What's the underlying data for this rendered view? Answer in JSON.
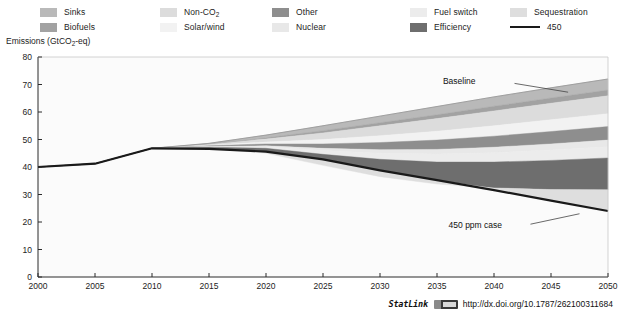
{
  "legend": {
    "items": [
      {
        "label": "Sinks",
        "color": "#b9b9b9",
        "type": "swatch",
        "col": 0,
        "row": 0
      },
      {
        "label": "Biofuels",
        "color": "#a2a2a2",
        "type": "swatch",
        "col": 0,
        "row": 1
      },
      {
        "label": "Non-CO2",
        "color": "#dcdcdc",
        "type": "swatch",
        "col": 1,
        "row": 0,
        "sub": "2",
        "base": "Non-CO"
      },
      {
        "label": "Solar/wind",
        "color": "#f2f2f2",
        "type": "swatch",
        "col": 1,
        "row": 1
      },
      {
        "label": "Other",
        "color": "#8e8e8e",
        "type": "swatch",
        "col": 2,
        "row": 0
      },
      {
        "label": "Nuclear",
        "color": "#e8e8e8",
        "type": "swatch",
        "col": 2,
        "row": 1
      },
      {
        "label": "Fuel switch",
        "color": "#ececec",
        "type": "swatch",
        "col": 3,
        "row": 0
      },
      {
        "label": "Efficiency",
        "color": "#6e6e6e",
        "type": "swatch",
        "col": 3,
        "row": 1
      },
      {
        "label": "Sequestration",
        "color": "#dedede",
        "type": "swatch",
        "col": 4,
        "row": 0
      },
      {
        "label": "450",
        "color": "#1a1a1a",
        "type": "line",
        "col": 4,
        "row": 1
      }
    ]
  },
  "chart_data": {
    "type": "area",
    "title": "",
    "xlabel": "",
    "ylabel": "Emissions (GtCO2-eq)",
    "ylabel_base": "Emissions (GtCO",
    "ylabel_sub": "2",
    "ylabel_tail": "-eq)",
    "xlim": [
      2000,
      2050
    ],
    "ylim": [
      0,
      80
    ],
    "ytick_values": [
      0,
      10,
      20,
      30,
      40,
      50,
      60,
      70,
      80
    ],
    "xtick_values": [
      2000,
      2005,
      2010,
      2015,
      2020,
      2025,
      2030,
      2035,
      2040,
      2045,
      2050
    ],
    "grid": false,
    "legend_position": "top",
    "x": [
      2000,
      2005,
      2010,
      2015,
      2020,
      2025,
      2030,
      2035,
      2040,
      2045,
      2050
    ],
    "series": [
      {
        "name": "Baseline",
        "values": [
          40.0,
          41.2,
          46.8,
          48.6,
          51.6,
          55.0,
          58.5,
          62.0,
          65.5,
          68.8,
          72.0
        ]
      },
      {
        "name": "450 ppm case",
        "values": [
          40.0,
          41.2,
          46.8,
          46.6,
          45.6,
          42.8,
          38.8,
          35.2,
          31.6,
          27.8,
          24.0
        ]
      }
    ],
    "wedges": [
      {
        "name": "Sinks",
        "color": "#b9b9b9",
        "values": [
          0,
          0,
          0,
          0.3,
          1.0,
          1.8,
          2.4,
          3.0,
          3.4,
          3.7,
          4.0
        ]
      },
      {
        "name": "Biofuels",
        "color": "#a2a2a2",
        "values": [
          0,
          0,
          0,
          0.1,
          0.4,
          0.8,
          1.1,
          1.4,
          1.7,
          1.9,
          2.1
        ]
      },
      {
        "name": "Non-CO2",
        "color": "#dcdcdc",
        "values": [
          0,
          0,
          0,
          0.3,
          1.1,
          2.4,
          3.6,
          4.6,
          5.4,
          6.0,
          6.5
        ]
      },
      {
        "name": "Solar/wind",
        "color": "#f2f2f2",
        "values": [
          0,
          0,
          0,
          0.2,
          0.7,
          1.6,
          2.5,
          3.2,
          3.8,
          4.3,
          4.7
        ]
      },
      {
        "name": "Other",
        "color": "#8e8e8e",
        "values": [
          0,
          0,
          0,
          0.2,
          0.7,
          1.6,
          2.6,
          3.4,
          4.0,
          4.5,
          4.9
        ]
      },
      {
        "name": "Nuclear",
        "color": "#e8e8e8",
        "values": [
          0,
          0,
          0,
          0.1,
          0.3,
          0.8,
          1.3,
          1.7,
          2.0,
          2.2,
          2.4
        ]
      },
      {
        "name": "Fuel switch",
        "color": "#ececec",
        "values": [
          0,
          0,
          0,
          0.2,
          0.6,
          1.4,
          2.2,
          2.9,
          3.4,
          3.8,
          4.1
        ]
      },
      {
        "name": "Efficiency",
        "color": "#6e6e6e",
        "values": [
          0,
          0,
          0,
          0.5,
          1.8,
          4.0,
          6.3,
          8.0,
          9.4,
          10.6,
          11.6
        ]
      },
      {
        "name": "Sequestration",
        "color": "#dedede",
        "values": [
          0,
          0,
          0,
          0.1,
          0.8,
          2.0,
          3.4,
          4.6,
          5.6,
          6.5,
          7.7
        ]
      }
    ],
    "annotations": [
      {
        "text": "Baseline",
        "x": 2038.5,
        "y": 71.0
      },
      {
        "text": "450 ppm case",
        "x": 2039.0,
        "y": 18.5
      }
    ]
  },
  "footer": {
    "statlink_word": "StatLink",
    "statlink_icon": "statlink-barcode-icon",
    "url": "http://dx.doi.org/10.1787/262100311684"
  }
}
